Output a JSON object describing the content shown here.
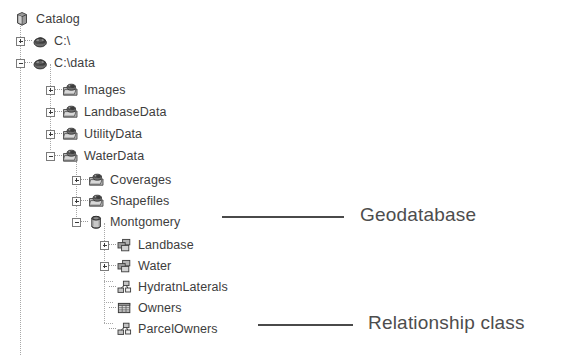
{
  "tree": {
    "nodes": [
      {
        "label": "Catalog",
        "icon": "catalog-cube-icon",
        "expander": "none",
        "depth": 0,
        "y": 8
      },
      {
        "label": "C:\\",
        "icon": "drive-icon",
        "expander": "plus",
        "depth": 1,
        "y": 30
      },
      {
        "label": "C:\\data",
        "icon": "drive-icon",
        "expander": "minus",
        "depth": 1,
        "y": 52
      },
      {
        "label": "Images",
        "icon": "folder-icon",
        "expander": "plus",
        "depth": 2,
        "y": 79
      },
      {
        "label": "LandbaseData",
        "icon": "folder-icon",
        "expander": "plus",
        "depth": 2,
        "y": 101
      },
      {
        "label": "UtilityData",
        "icon": "folder-icon",
        "expander": "plus",
        "depth": 2,
        "y": 123
      },
      {
        "label": "WaterData",
        "icon": "folder-icon",
        "expander": "minus",
        "depth": 2,
        "y": 145
      },
      {
        "label": "Coverages",
        "icon": "folder-icon",
        "expander": "plus",
        "depth": 3,
        "y": 169
      },
      {
        "label": "Shapefiles",
        "icon": "folder-icon",
        "expander": "plus",
        "depth": 3,
        "y": 190
      },
      {
        "label": "Montgomery",
        "icon": "geodatabase-icon",
        "expander": "minus",
        "depth": 3,
        "y": 211
      },
      {
        "label": "Landbase",
        "icon": "feature-dataset-icon",
        "expander": "plus",
        "depth": 4,
        "y": 234
      },
      {
        "label": "Water",
        "icon": "feature-dataset-icon",
        "expander": "plus",
        "depth": 4,
        "y": 255
      },
      {
        "label": "HydratnLaterals",
        "icon": "relationship-class-icon",
        "expander": "none",
        "depth": 4,
        "y": 276
      },
      {
        "label": "Owners",
        "icon": "table-icon",
        "expander": "none",
        "depth": 4,
        "y": 297
      },
      {
        "label": "ParcelOwners",
        "icon": "relationship-class-icon",
        "expander": "none",
        "depth": 4,
        "y": 318
      }
    ]
  },
  "annotations": [
    {
      "label": "Geodatabase",
      "name": "annotation-geodatabase",
      "text_x": 360,
      "text_y": 205,
      "line_x": 222,
      "line_y": 216,
      "line_w": 122
    },
    {
      "label": "Relationship class",
      "name": "annotation-relationship-class",
      "text_x": 368,
      "text_y": 313,
      "line_x": 258,
      "line_y": 324,
      "line_w": 95
    }
  ],
  "colors": {
    "text": "#3d3d3d",
    "annotation_text": "#4d4d4d",
    "leader_line": "#4a4a4a",
    "guide_line": "#a8a8a8",
    "background": "#ffffff"
  }
}
